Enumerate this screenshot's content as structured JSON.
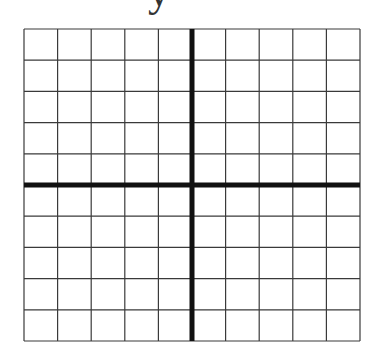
{
  "diagram": {
    "type": "coordinate-grid",
    "y_axis_label": "y",
    "columns": 10,
    "rows": 10,
    "grid_left": 24,
    "grid_top": 29,
    "grid_right": 360,
    "grid_bottom": 341,
    "x_axis_row_index": 5,
    "y_axis_col_index": 5,
    "colors": {
      "background": "#ffffff",
      "grid_line": "#3a3a3a",
      "axis_line": "#111111",
      "label": "#333333"
    },
    "grid_line_width": 1.2,
    "axis_line_width": 5
  }
}
